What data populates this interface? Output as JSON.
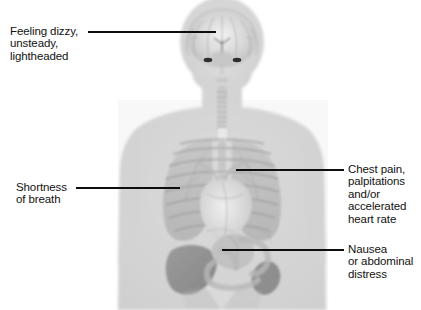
{
  "figure": {
    "width": 421,
    "height": 310,
    "background_color": "#ffffff"
  },
  "illustration": {
    "name": "semi-transparent human torso with internal organs",
    "body_color": "#d6d6d6",
    "organ_tint": "#b4b4b4",
    "organ_dark": "#8d8d8d",
    "parts": [
      {
        "name": "brain",
        "region": "head"
      },
      {
        "name": "eyes",
        "region": "face"
      },
      {
        "name": "trachea",
        "region": "neck"
      },
      {
        "name": "lungs",
        "region": "chest"
      },
      {
        "name": "ribcage",
        "region": "chest"
      },
      {
        "name": "heart",
        "region": "chest"
      },
      {
        "name": "liver",
        "region": "abdomen"
      },
      {
        "name": "stomach",
        "region": "abdomen"
      },
      {
        "name": "intestines",
        "region": "abdomen"
      },
      {
        "name": "spleen",
        "region": "abdomen"
      }
    ]
  },
  "callouts": [
    {
      "id": "dizziness",
      "side": "left",
      "text": "Feeling dizzy,\nunsteady,\nlightheaded",
      "target_organ": "brain",
      "line": {
        "x1": 88,
        "y1": 32,
        "x2": 216,
        "y2": 32
      },
      "text_pos": {
        "x": 10,
        "y": 25
      }
    },
    {
      "id": "shortness-of-breath",
      "side": "left",
      "text": "Shortness\nof breath",
      "target_organ": "lungs",
      "line": {
        "x1": 76,
        "y1": 188,
        "x2": 180,
        "y2": 188
      },
      "text_pos": {
        "x": 16,
        "y": 181
      }
    },
    {
      "id": "chest-pain",
      "side": "right",
      "text": "Chest pain,\npalpitations\nand/or\naccelerated\nheart rate",
      "target_organ": "heart",
      "line": {
        "x1": 236,
        "y1": 170,
        "x2": 344,
        "y2": 170
      },
      "text_pos": {
        "x": 348,
        "y": 163
      }
    },
    {
      "id": "nausea",
      "side": "right",
      "text": "Nausea\nor abdominal\ndistress",
      "target_organ": "stomach",
      "line": {
        "x1": 222,
        "y1": 250,
        "x2": 344,
        "y2": 250
      },
      "text_pos": {
        "x": 348,
        "y": 243
      }
    }
  ]
}
